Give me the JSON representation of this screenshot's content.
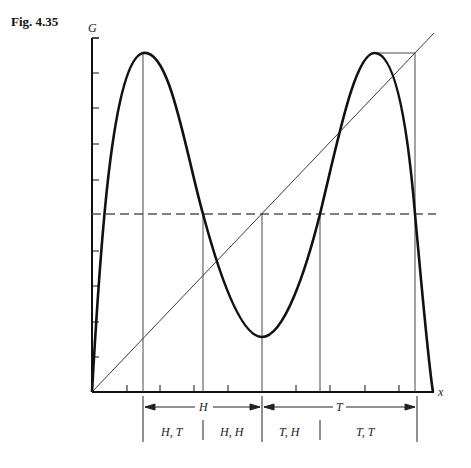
{
  "figure": {
    "label": "Fig. 4.35",
    "y_axis_label": "G",
    "x_axis_label": "x"
  },
  "annotations": {
    "range_H": "H",
    "range_T": "T",
    "cells": [
      "H, T",
      "H, H",
      "T, H",
      "T, T"
    ]
  },
  "diagram": {
    "elements": [
      "double-hump curve G(x)",
      "diagonal y=x",
      "dashed horizontal midline",
      "vertical guide lines at peaks, crossings, minimum",
      "cobweb box at right peak"
    ],
    "colors": {
      "curve": "#111111",
      "guides": "#333333",
      "dashed": "#555555"
    }
  }
}
